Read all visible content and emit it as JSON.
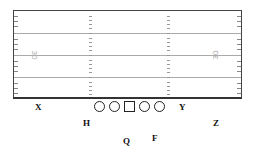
{
  "diagram": {
    "type": "football-formation",
    "field": {
      "yard_numbers": [
        {
          "text": "30",
          "side": "left",
          "rotation": "90deg"
        },
        {
          "text": "30",
          "side": "right",
          "rotation": "-90deg"
        }
      ]
    },
    "offensive_line": [
      {
        "id": "LT",
        "shape": "circle"
      },
      {
        "id": "LG",
        "shape": "circle"
      },
      {
        "id": "C",
        "shape": "square"
      },
      {
        "id": "RG",
        "shape": "circle"
      },
      {
        "id": "RT",
        "shape": "circle"
      }
    ],
    "skill_players": {
      "X": "X",
      "H": "H",
      "Q": "Q",
      "F": "F",
      "Y": "Y",
      "Z": "Z"
    }
  }
}
